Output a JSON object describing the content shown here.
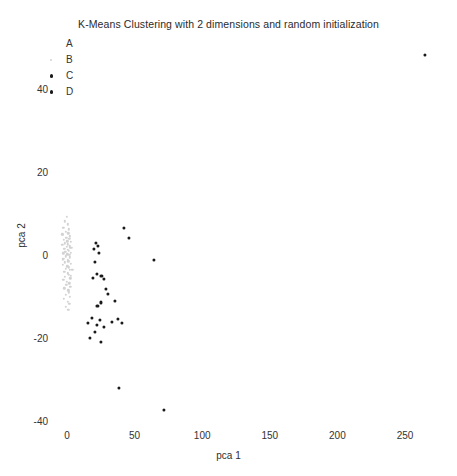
{
  "chart_data": {
    "type": "scatter",
    "title": "K-Means Clustering with 2 dimensions and random initialization",
    "xlabel": "pca 1",
    "ylabel": "pca 2",
    "xlim": [
      -13,
      281
    ],
    "ylim": [
      -46,
      47
    ],
    "xticks": [
      0,
      50,
      100,
      150,
      200,
      250
    ],
    "yticks": [
      40,
      20,
      0,
      -20,
      -40
    ],
    "xtick_labels": [
      "0",
      "50",
      "100",
      "150",
      "200",
      "250"
    ],
    "ytick_labels": [
      "40",
      "20",
      "0",
      "-20",
      "-40"
    ],
    "grid": false,
    "legend_position": "upper-left",
    "legend_entries": [
      "A",
      "B",
      "C",
      "D"
    ],
    "series": [
      {
        "name": "A",
        "color": "#ffffff",
        "marker": "circle",
        "marker_size": 2.6,
        "points": []
      },
      {
        "name": "B",
        "color": "#d2d2d2",
        "marker": "circle",
        "marker_size": 2.4,
        "points": [
          [
            -1.8,
            8.1
          ],
          [
            0.4,
            7.4
          ],
          [
            -2.6,
            6.6
          ],
          [
            1.2,
            6.2
          ],
          [
            -1.1,
            5.6
          ],
          [
            0.9,
            5.2
          ],
          [
            -3.1,
            4.8
          ],
          [
            2.1,
            4.5
          ],
          [
            -0.6,
            4.2
          ],
          [
            1.6,
            3.9
          ],
          [
            -2.2,
            3.6
          ],
          [
            0.2,
            3.3
          ],
          [
            2.8,
            3.1
          ],
          [
            -1.5,
            2.8
          ],
          [
            0.7,
            2.6
          ],
          [
            -3.4,
            2.4
          ],
          [
            1.9,
            2.1
          ],
          [
            -0.3,
            1.9
          ],
          [
            2.4,
            1.7
          ],
          [
            -2.0,
            1.5
          ],
          [
            0.5,
            1.3
          ],
          [
            1.4,
            1.0
          ],
          [
            -1.2,
            0.8
          ],
          [
            3.0,
            0.6
          ],
          [
            -2.8,
            0.4
          ],
          [
            0.1,
            0.2
          ],
          [
            1.7,
            0.0
          ],
          [
            -0.8,
            -0.3
          ],
          [
            2.2,
            -0.6
          ],
          [
            -2.4,
            -0.9
          ],
          [
            0.8,
            -1.2
          ],
          [
            1.1,
            -1.5
          ],
          [
            -1.7,
            -1.8
          ],
          [
            2.6,
            -2.1
          ],
          [
            -3.0,
            -2.4
          ],
          [
            0.3,
            -2.7
          ],
          [
            1.5,
            -3.0
          ],
          [
            -0.9,
            -3.3
          ],
          [
            2.0,
            -3.6
          ],
          [
            -2.1,
            -4.0
          ],
          [
            0.6,
            -4.4
          ],
          [
            1.3,
            -4.8
          ],
          [
            -1.4,
            -5.2
          ],
          [
            2.3,
            -5.6
          ],
          [
            -2.6,
            -6.0
          ],
          [
            0.0,
            -6.4
          ],
          [
            1.8,
            -6.8
          ],
          [
            -0.5,
            -7.2
          ],
          [
            2.5,
            -7.6
          ],
          [
            -1.9,
            -8.0
          ],
          [
            0.9,
            -8.5
          ],
          [
            1.2,
            -9.0
          ],
          [
            -1.1,
            -9.5
          ],
          [
            2.1,
            -10.0
          ],
          [
            -2.3,
            -10.6
          ],
          [
            0.4,
            -11.2
          ],
          [
            1.6,
            -11.8
          ],
          [
            -0.7,
            -12.4
          ],
          [
            2.8,
            -5.0
          ],
          [
            -3.2,
            -1.0
          ],
          [
            3.4,
            1.8
          ],
          [
            -3.6,
            5.0
          ],
          [
            3.8,
            -3.5
          ],
          [
            -0.2,
            9.2
          ],
          [
            1.0,
            -13.2
          ]
        ]
      },
      {
        "name": "C",
        "color": "#1a1a1a",
        "marker": "circle",
        "marker_size": 3.1,
        "points": [
          [
            42.0,
            6.5
          ],
          [
            45.5,
            4.2
          ],
          [
            21.5,
            3.0
          ],
          [
            22.8,
            2.2
          ],
          [
            20.2,
            1.4
          ],
          [
            23.5,
            0.4
          ],
          [
            21.0,
            -1.6
          ],
          [
            22.0,
            -4.6
          ],
          [
            19.5,
            -5.6
          ],
          [
            25.5,
            -5.0
          ],
          [
            27.2,
            -5.8
          ],
          [
            64.5,
            -1.2
          ],
          [
            29.0,
            -8.2
          ],
          [
            30.5,
            -9.4
          ],
          [
            25.0,
            -11.4
          ],
          [
            22.5,
            -12.2
          ],
          [
            35.5,
            -11.0
          ]
        ]
      },
      {
        "name": "D",
        "color": "#1a1a1a",
        "marker": "circle",
        "marker_size": 3.1,
        "points": [
          [
            265.0,
            48.0
          ],
          [
            15.5,
            -16.4
          ],
          [
            18.5,
            -15.2
          ],
          [
            22.0,
            -16.8
          ],
          [
            24.5,
            -15.6
          ],
          [
            21.0,
            -18.6
          ],
          [
            27.5,
            -17.2
          ],
          [
            33.0,
            -16.2
          ],
          [
            38.0,
            -15.4
          ],
          [
            40.5,
            -16.4
          ],
          [
            17.0,
            -20.0
          ],
          [
            25.0,
            -20.8
          ],
          [
            38.5,
            -32.0
          ],
          [
            72.0,
            -37.2
          ]
        ]
      }
    ]
  },
  "axis_scale": {
    "x_pixel_at_zero": 67,
    "x_pixels_per_unit": 1.352,
    "y_pixel_at_zero": 255,
    "y_pixels_per_unit": 4.16
  },
  "bottom_artifact_text": "........"
}
